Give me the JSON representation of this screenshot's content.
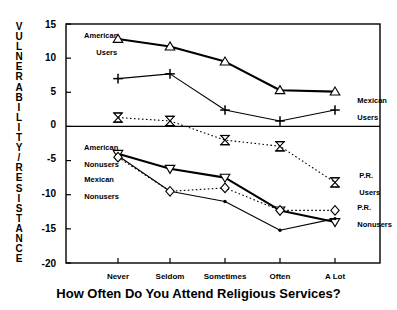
{
  "chart_data": {
    "type": "line",
    "title": "",
    "xlabel": "How Often Do You Attend Religious Services?",
    "ylabel": "VULNERABILITY/RESISTANCE",
    "categories": [
      "Never",
      "Seldom",
      "Sometimes",
      "Often",
      "A Lot"
    ],
    "ylim": [
      -20,
      15
    ],
    "yticks": [
      15,
      10,
      5,
      0,
      -5,
      -10,
      -15,
      -20
    ],
    "ytick_labels": [
      "15",
      "10",
      "5",
      "0",
      "-5",
      "-10",
      "-15",
      "-20"
    ],
    "grid": false,
    "legend_position": "inline-annotations",
    "zero_line": true,
    "series": [
      {
        "name": "American Users",
        "marker": "triangle-up",
        "line": "solid-thick",
        "values": [
          12.8,
          11.7,
          9.5,
          5.3,
          5.1
        ]
      },
      {
        "name": "Mexican Users",
        "marker": "plus",
        "line": "solid-thin",
        "values": [
          7.0,
          7.7,
          2.4,
          0.8,
          2.4
        ]
      },
      {
        "name": "P.R. Users",
        "marker": "hourglass",
        "line": "dotted",
        "values": [
          1.3,
          0.8,
          -2.0,
          -2.9,
          -8.2
        ]
      },
      {
        "name": "American Nonusers",
        "marker": "triangle-down",
        "line": "solid-thick",
        "values": [
          -4.0,
          -6.2,
          -7.5,
          -12.3,
          -14.0
        ]
      },
      {
        "name": "Mexican Nonusers",
        "marker": "dot",
        "line": "solid-thin",
        "values": [
          -4.3,
          -9.5,
          -11.0,
          -15.2,
          -13.5
        ]
      },
      {
        "name": "P.R. Nonusers",
        "marker": "diamond",
        "line": "dotted",
        "values": [
          -4.5,
          -9.5,
          -9.0,
          -12.3,
          -12.3
        ]
      }
    ],
    "annotations": [
      {
        "text": "American\nUsers",
        "series": "American Users"
      },
      {
        "text": "Mexican\nUsers",
        "series": "Mexican Users"
      },
      {
        "text": "P.R.\nUsers",
        "series": "P.R. Users"
      },
      {
        "text": "American\nNonusers",
        "series": "American Nonusers"
      },
      {
        "text": "Mexican\nNonusers",
        "series": "Mexican Nonusers"
      },
      {
        "text": "P.R.\nNonusers",
        "series": "P.R. Nonusers"
      }
    ]
  },
  "axis": {
    "y_label_letters": [
      "V",
      "U",
      "L",
      "N",
      "E",
      "R",
      "A",
      "B",
      "I",
      "L",
      "I",
      "T",
      "Y",
      "/",
      "R",
      "E",
      "S",
      "I",
      "S",
      "T",
      "A",
      "N",
      "C",
      "E"
    ],
    "x_title": "How Often Do You Attend Religious Services?"
  },
  "labels": {
    "american_users_1": "American",
    "american_users_2": "Users",
    "mexican_users_1": "Mexican",
    "mexican_users_2": "Users",
    "pr_users_1": "P.R.",
    "pr_users_2": "Users",
    "american_nonusers_1": "American",
    "american_nonusers_2": "Nonusers",
    "mexican_nonusers_1": "Mexican",
    "mexican_nonusers_2": "Nonusers",
    "pr_nonusers_1": "P.R.",
    "pr_nonusers_2": "Nonusers"
  }
}
